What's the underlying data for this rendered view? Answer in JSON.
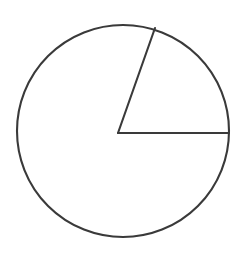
{
  "canvas": {
    "width": 245,
    "height": 256,
    "background_color": "#ffffff"
  },
  "figure": {
    "name": "pie-chart-single-sector",
    "stroke_color": "#3a3a3a",
    "stroke_width": 2,
    "fill_color": "#ffffff",
    "circle": {
      "center_x": 123,
      "center_y": 131,
      "radius": 106
    },
    "radii": [
      {
        "name": "horizontal-radius",
        "angle_deg": 0,
        "end_x": 229,
        "end_y": 133
      },
      {
        "name": "slanted-radius",
        "angle_deg": 71,
        "end_x": 155,
        "end_y": 28
      }
    ],
    "wedge_vertex": {
      "x": 118,
      "y": 133
    }
  },
  "chart_data": {
    "type": "pie",
    "title": "",
    "subtitle": "",
    "xlabel": "",
    "ylabel": "",
    "grid": false,
    "legend": "none",
    "labels": [
      "Sector",
      "Remainder"
    ],
    "values": [
      20,
      80
    ],
    "units": "percent",
    "slice_angles_deg": [
      71,
      289
    ],
    "start_angle_deg": 0,
    "direction": "counterclockwise",
    "colors": [
      "#ffffff",
      "#ffffff"
    ],
    "edge_color": "#3a3a3a",
    "annotations": []
  }
}
